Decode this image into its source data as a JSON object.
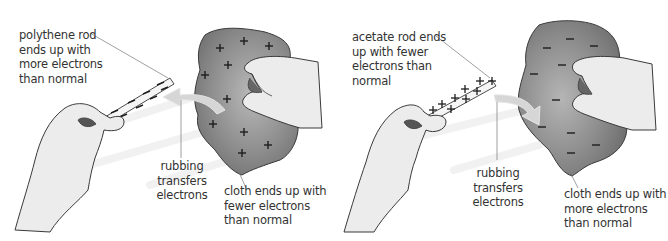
{
  "panels": [
    {
      "rod": "polythene rod",
      "rod_label": "polythene rod\nends up with\nmore electrons\nthan normal",
      "rod_charge": "-",
      "rubbing_label": "rubbing\ntransfers\nelectrons",
      "cloth_label": "cloth ends up with\nfewer electrons\nthan normal",
      "cloth_charge": "+",
      "arrow_direction": "cloth-to-rod"
    },
    {
      "rod": "acetate rod",
      "rod_label": "acetate rod ends\nup with fewer\nelectrons than\nnormal",
      "rod_charge": "+",
      "rubbing_label": "rubbing\ntransfers\nelectrons",
      "cloth_label": "cloth ends up with\nmore electrons\nthan normal",
      "cloth_charge": "-",
      "arrow_direction": "rod-to-cloth"
    }
  ],
  "colors": {
    "cloth": "#8a8a8a",
    "cloth_light": "#b5b5b5",
    "hand": "#ececec",
    "outline": "#3a3a3a",
    "arrow": "#d6d6d6",
    "text": "#333333"
  }
}
